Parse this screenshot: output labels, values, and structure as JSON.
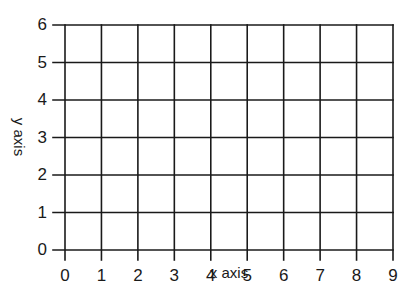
{
  "chart_data": {
    "type": "line",
    "title": "",
    "xlabel": "x axis",
    "ylabel": "y axis",
    "x_ticks": [
      "0",
      "1",
      "2",
      "3",
      "4",
      "5",
      "6",
      "7",
      "8",
      "9"
    ],
    "y_ticks": [
      "0",
      "1",
      "2",
      "3",
      "4",
      "5",
      "6"
    ],
    "xlim": [
      0,
      9
    ],
    "ylim": [
      0,
      6
    ],
    "grid": true,
    "series": [],
    "legend": null
  },
  "colors": {
    "grid": "#1a1a1a",
    "background": "#ffffff",
    "text": "#1a1a1a"
  }
}
